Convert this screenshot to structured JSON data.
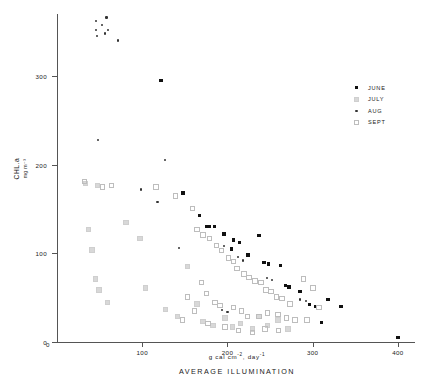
{
  "chart_data": {
    "type": "scatter",
    "title": "",
    "xlabel": "AVERAGE ILLUMINATION",
    "xunits_prefix": "g cal cm",
    "xunits_exp1": "-2",
    "xunits_mid": ", day",
    "xunits_exp2": "-1",
    "ylabel": "CHL.a",
    "yunits": "mg m⁻³",
    "xlim": [
      0,
      420
    ],
    "ylim": [
      0,
      370
    ],
    "xticks": [
      0,
      100,
      200,
      300,
      400
    ],
    "yticks": [
      0,
      100,
      200,
      300
    ],
    "xtick_labels": [
      "0",
      "100",
      "200",
      "300",
      "400"
    ],
    "ytick_labels": [
      "0",
      "100",
      "200",
      "300"
    ],
    "grid": false,
    "legend_position": "top-right",
    "series": [
      {
        "name": "JUNE",
        "marker": "filled-square",
        "color": "#111111",
        "points": [
          [
            122,
            295
          ],
          [
            148,
            168
          ],
          [
            167,
            143
          ],
          [
            176,
            130
          ],
          [
            179,
            130
          ],
          [
            185,
            130
          ],
          [
            196,
            122
          ],
          [
            207,
            115
          ],
          [
            205,
            105
          ],
          [
            214,
            112
          ],
          [
            224,
            98
          ],
          [
            237,
            120
          ],
          [
            243,
            90
          ],
          [
            248,
            88
          ],
          [
            262,
            86
          ],
          [
            268,
            64
          ],
          [
            272,
            62
          ],
          [
            285,
            57
          ],
          [
            296,
            42
          ],
          [
            303,
            40
          ],
          [
            310,
            22
          ],
          [
            318,
            48
          ],
          [
            333,
            40
          ],
          [
            400,
            5
          ]
        ]
      },
      {
        "name": "JULY",
        "marker": "light-square",
        "color": "#d8d8d8",
        "points": [
          [
            32,
            180
          ],
          [
            46,
            178
          ],
          [
            36,
            128
          ],
          [
            40,
            105
          ],
          [
            44,
            72
          ],
          [
            48,
            60
          ],
          [
            58,
            46
          ],
          [
            80,
            136
          ],
          [
            96,
            118
          ],
          [
            103,
            62
          ],
          [
            126,
            38
          ],
          [
            140,
            30
          ],
          [
            152,
            86
          ],
          [
            163,
            44
          ],
          [
            170,
            24
          ],
          [
            182,
            20
          ],
          [
            196,
            28
          ],
          [
            205,
            18
          ],
          [
            214,
            22
          ],
          [
            228,
            16
          ],
          [
            236,
            30
          ],
          [
            246,
            20
          ],
          [
            258,
            26
          ],
          [
            270,
            16
          ]
        ]
      },
      {
        "name": "AUG",
        "marker": "dot",
        "color": "#333333",
        "points": [
          [
            46,
            352
          ],
          [
            47,
            345
          ],
          [
            46,
            362
          ],
          [
            53,
            358
          ],
          [
            56,
            348
          ],
          [
            58,
            366
          ],
          [
            60,
            352
          ],
          [
            72,
            340
          ],
          [
            48,
            228
          ],
          [
            127,
            205
          ],
          [
            99,
            172
          ],
          [
            118,
            158
          ],
          [
            143,
            106
          ],
          [
            196,
            108
          ],
          [
            212,
            96
          ],
          [
            218,
            92
          ],
          [
            246,
            72
          ],
          [
            252,
            70
          ],
          [
            194,
            36
          ],
          [
            200,
            34
          ],
          [
            285,
            48
          ],
          [
            292,
            46
          ]
        ]
      },
      {
        "name": "SEPT",
        "marker": "open-square",
        "color": "#bdbdbd",
        "points": [
          [
            31,
            182
          ],
          [
            52,
            176
          ],
          [
            63,
            178
          ],
          [
            115,
            176
          ],
          [
            138,
            166
          ],
          [
            158,
            152
          ],
          [
            163,
            128
          ],
          [
            170,
            122
          ],
          [
            178,
            118
          ],
          [
            186,
            110
          ],
          [
            192,
            104
          ],
          [
            200,
            96
          ],
          [
            206,
            92
          ],
          [
            210,
            84
          ],
          [
            218,
            78
          ],
          [
            224,
            74
          ],
          [
            231,
            70
          ],
          [
            238,
            68
          ],
          [
            244,
            60
          ],
          [
            250,
            58
          ],
          [
            256,
            52
          ],
          [
            263,
            50
          ],
          [
            272,
            44
          ],
          [
            168,
            68
          ],
          [
            174,
            56
          ],
          [
            184,
            46
          ],
          [
            190,
            42
          ],
          [
            206,
            40
          ],
          [
            215,
            36
          ],
          [
            222,
            30
          ],
          [
            236,
            30
          ],
          [
            246,
            34
          ],
          [
            258,
            32
          ],
          [
            268,
            28
          ],
          [
            278,
            26
          ],
          [
            288,
            72
          ],
          [
            299,
            62
          ],
          [
            292,
            26
          ],
          [
            306,
            40
          ],
          [
            152,
            52
          ],
          [
            160,
            36
          ],
          [
            146,
            26
          ],
          [
            176,
            22
          ],
          [
            196,
            18
          ],
          [
            212,
            14
          ],
          [
            228,
            12
          ],
          [
            243,
            16
          ],
          [
            259,
            14
          ]
        ]
      }
    ]
  }
}
